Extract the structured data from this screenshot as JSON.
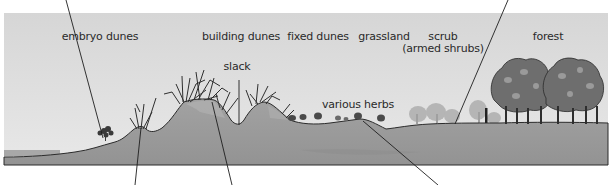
{
  "diagram": {
    "type": "sand dune succession cross-section",
    "colors": {
      "sky": "#dcdcdc",
      "ground": "#9a9a9a",
      "ground_dark": "#8a8a8a",
      "dune_highlight": "#aaaaaa",
      "outline": "#2b2b2b",
      "tree_light": "#8f8f8f",
      "tree_dark": "#4a4a4a",
      "background_trees": "#b8b8b8"
    },
    "zone_labels": [
      {
        "id": "embryo-dunes",
        "text": "embryo dunes",
        "x": 100,
        "y": 37
      },
      {
        "id": "building-dunes",
        "text": "building dunes",
        "x": 241,
        "y": 37
      },
      {
        "id": "fixed-dunes",
        "text": "fixed dunes",
        "x": 318,
        "y": 37
      },
      {
        "id": "grassland",
        "text": "grassland",
        "x": 384,
        "y": 37
      },
      {
        "id": "scrub",
        "text": "scrub",
        "x": 443,
        "y": 37
      },
      {
        "id": "scrub-sub",
        "text": "(armed shrubs)",
        "x": 443,
        "y": 49
      },
      {
        "id": "forest",
        "text": "forest",
        "x": 548,
        "y": 37
      }
    ],
    "annotations": [
      {
        "id": "slack",
        "text": "slack",
        "x": 237,
        "y": 67
      },
      {
        "id": "various-herbs",
        "text": "various herbs",
        "x": 358,
        "y": 105
      }
    ],
    "leader_lines": [
      {
        "id": "line-embryo-plant",
        "x1": 66,
        "y1": 0,
        "x2": 103,
        "y2": 138
      },
      {
        "id": "line-embryo-crest",
        "x1": 141,
        "y1": 128,
        "x2": 135,
        "y2": 185
      },
      {
        "id": "line-building-dune",
        "x1": 212,
        "y1": 102,
        "x2": 232,
        "y2": 185
      },
      {
        "id": "line-slack",
        "x1": 239,
        "y1": 80,
        "x2": 239,
        "y2": 125
      },
      {
        "id": "line-fixed-dune",
        "x1": 363,
        "y1": 121,
        "x2": 438,
        "y2": 185
      },
      {
        "id": "line-scrub",
        "x1": 508,
        "y1": 0,
        "x2": 455,
        "y2": 124
      }
    ]
  }
}
